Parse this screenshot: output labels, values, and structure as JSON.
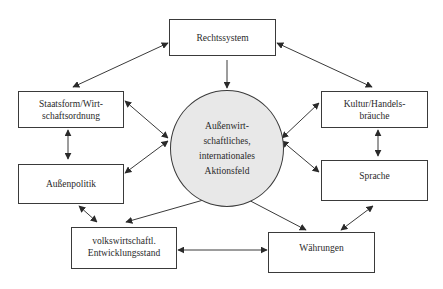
{
  "diagram": {
    "center": {
      "lines": [
        "Außenwirt-",
        "schaftliches,",
        "internationales",
        "Aktionsfeld"
      ],
      "fill": "#e8e8e8"
    },
    "nodes": {
      "rechtssystem": {
        "lines": [
          "Rechtssystem"
        ]
      },
      "staatsform": {
        "lines": [
          "Staatsform/Wirt-",
          "schaftsordnung"
        ]
      },
      "aussenpolitik": {
        "lines": [
          "Außenpolitik"
        ]
      },
      "entwicklungsstand": {
        "lines": [
          "volkswirtschaftl.",
          "Entwicklungsstand"
        ]
      },
      "waehrungen": {
        "lines": [
          "Währungen"
        ]
      },
      "kultur": {
        "lines": [
          "Kultur/Handels-",
          "bräuche"
        ]
      },
      "sprache": {
        "lines": [
          "Sprache"
        ]
      }
    },
    "edges": [
      {
        "from": "rechtssystem",
        "to": "center",
        "direction": "one-way"
      },
      {
        "from": "rechtssystem",
        "to": "staatsform",
        "direction": "both"
      },
      {
        "from": "rechtssystem",
        "to": "kultur",
        "direction": "both"
      },
      {
        "from": "staatsform",
        "to": "center",
        "direction": "both"
      },
      {
        "from": "staatsform",
        "to": "aussenpolitik",
        "direction": "both"
      },
      {
        "from": "aussenpolitik",
        "to": "center",
        "direction": "both"
      },
      {
        "from": "aussenpolitik",
        "to": "entwicklungsstand",
        "direction": "both"
      },
      {
        "from": "entwicklungsstand",
        "to": "center",
        "direction": "both"
      },
      {
        "from": "entwicklungsstand",
        "to": "waehrungen",
        "direction": "both"
      },
      {
        "from": "waehrungen",
        "to": "center",
        "direction": "both"
      },
      {
        "from": "waehrungen",
        "to": "sprache",
        "direction": "both"
      },
      {
        "from": "kultur",
        "to": "center",
        "direction": "both"
      },
      {
        "from": "kultur",
        "to": "sprache",
        "direction": "both"
      },
      {
        "from": "sprache",
        "to": "center",
        "direction": "both"
      }
    ]
  }
}
